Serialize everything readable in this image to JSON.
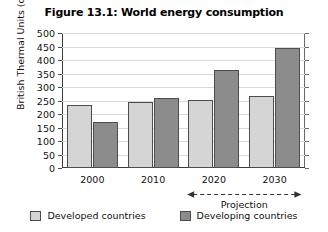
{
  "chart_data": {
    "type": "bar",
    "title": "Figure 13.1: World energy consumption",
    "xlabel": "",
    "ylabel": "British Thermal Units (quadrillions)",
    "categories": [
      "2000",
      "2010",
      "2020",
      "2030"
    ],
    "series": [
      {
        "name": "Developed countries",
        "color": "#d5d5d5",
        "values": [
          233,
          245,
          253,
          268
        ]
      },
      {
        "name": "Developing countries",
        "color": "#8c8c8c",
        "values": [
          172,
          260,
          362,
          445
        ]
      }
    ],
    "ylim": [
      0,
      500
    ],
    "yticks": [
      0,
      50,
      100,
      150,
      200,
      250,
      300,
      350,
      400,
      450,
      500
    ],
    "ytick_labels": [
      "0",
      "50",
      "100",
      "150",
      "200",
      "250",
      "300",
      "350",
      "400",
      "450",
      "500"
    ],
    "grid": "horizontal",
    "legend_position": "bottom",
    "annotations": [
      {
        "text": "Projection",
        "type": "double-headed-dashed-arrow",
        "spans": [
          "2020",
          "2030"
        ]
      }
    ]
  },
  "legend": {
    "items": [
      {
        "label": "Developed countries",
        "color": "#d5d5d5"
      },
      {
        "label": "Developing countries",
        "color": "#8c8c8c"
      }
    ]
  },
  "annotation": {
    "projection_label": "Projection"
  }
}
